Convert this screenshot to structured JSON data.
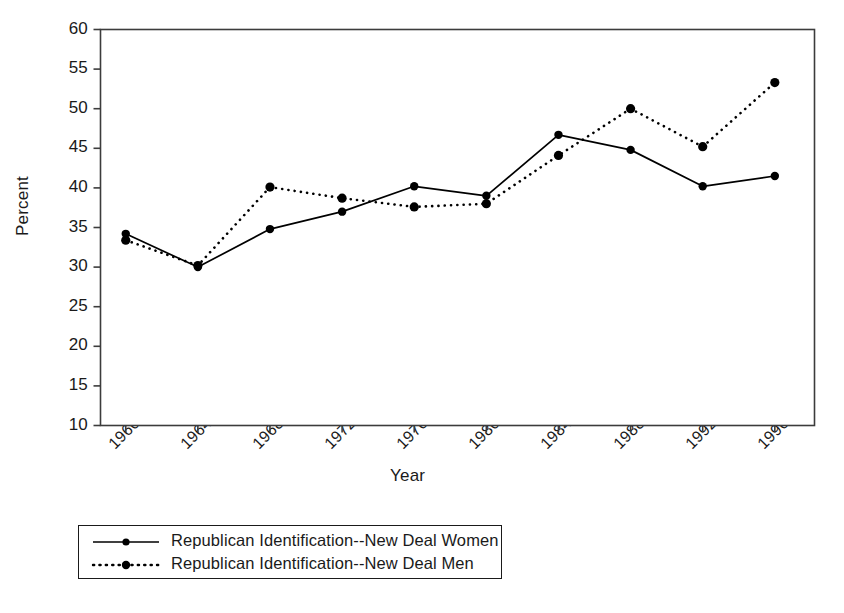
{
  "chart_data": {
    "type": "line",
    "title": "",
    "xlabel": "Year",
    "ylabel": "Percent",
    "x": [
      1960,
      1964,
      1968,
      1972,
      1976,
      1980,
      1984,
      1988,
      1992,
      1996
    ],
    "xticklabels": [
      "1960",
      "1964",
      "1968",
      "1972",
      "1976",
      "1980",
      "1984",
      "1988",
      "1992",
      "1996"
    ],
    "yticklabels": [
      "10",
      "15",
      "20",
      "25",
      "30",
      "35",
      "40",
      "45",
      "50",
      "55",
      "60"
    ],
    "yticks": [
      10,
      15,
      20,
      25,
      30,
      35,
      40,
      45,
      50,
      55,
      60
    ],
    "ylim": [
      10,
      60
    ],
    "xlim": [
      1958.6,
      1998.2
    ],
    "grid": false,
    "legend_position": "below-axes",
    "series": [
      {
        "name": "Republican Identification--New Deal Women",
        "linestyle": "solid",
        "marker": "circle",
        "color": "#000000",
        "values": [
          34.2,
          30.0,
          34.8,
          37.0,
          40.2,
          39.0,
          46.7,
          44.8,
          40.2,
          41.5
        ]
      },
      {
        "name": "Republican Identification--New Deal Men",
        "linestyle": "dotted",
        "marker": "circle",
        "color": "#000000",
        "values": [
          33.4,
          30.2,
          40.1,
          38.7,
          37.6,
          38.0,
          44.1,
          50.0,
          45.2,
          53.3
        ]
      }
    ]
  },
  "axes": {
    "frame_color": "#3c3c3c",
    "background": "#ffffff"
  },
  "legend": {
    "entries": [
      {
        "label": "Republican Identification--New Deal Women",
        "style": "solid-with-marker"
      },
      {
        "label": "Republican Identification--New Deal Men",
        "style": "dotted-with-marker"
      }
    ]
  }
}
